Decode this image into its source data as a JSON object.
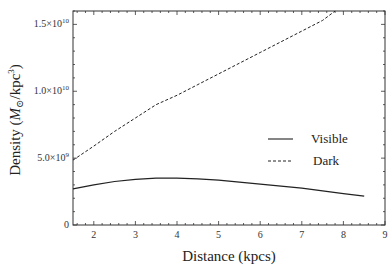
{
  "chart_data": {
    "type": "line",
    "title": "",
    "xlabel": "Distance (kpcs)",
    "ylabel": "Density (M⊙/kpc³)",
    "xlim": [
      1.5,
      9
    ],
    "ylim": [
      0,
      16000000000
    ],
    "x_ticks": [
      2,
      3,
      4,
      5,
      6,
      7,
      8,
      9
    ],
    "y_ticks": [
      {
        "value": 0,
        "label": "0"
      },
      {
        "value": 5000000000,
        "mantissa": "5.0",
        "exp": "9"
      },
      {
        "value": 10000000000,
        "mantissa": "1.0",
        "exp": "10"
      },
      {
        "value": 15000000000,
        "mantissa": "1.5",
        "exp": "10"
      }
    ],
    "grid": false,
    "legend_position": "center-right",
    "series": [
      {
        "name": "Visible",
        "style": "solid",
        "x": [
          1.5,
          2.0,
          2.5,
          3.0,
          3.5,
          4.0,
          4.5,
          5.0,
          5.5,
          6.0,
          6.5,
          7.0,
          7.5,
          8.0,
          8.5
        ],
        "values": [
          2700000000.0,
          3000000000.0,
          3250000000.0,
          3420000000.0,
          3500000000.0,
          3500000000.0,
          3450000000.0,
          3350000000.0,
          3200000000.0,
          3050000000.0,
          2900000000.0,
          2750000000.0,
          2550000000.0,
          2350000000.0,
          2150000000.0
        ]
      },
      {
        "name": "Dark",
        "style": "dashed",
        "x": [
          1.5,
          2.0,
          2.5,
          3.0,
          3.5,
          4.0,
          4.5,
          5.0,
          5.5,
          6.0,
          6.5,
          7.0,
          7.5,
          7.8
        ],
        "values": [
          4850000000.0,
          5900000000.0,
          7000000000.0,
          8000000000.0,
          9000000000.0,
          9700000000.0,
          10500000000.0,
          11300000000.0,
          12100000000.0,
          12900000000.0,
          13700000000.0,
          14500000000.0,
          15300000000.0,
          16000000000.0
        ]
      }
    ]
  },
  "axes": {
    "xlabel": "Distance (kpcs)",
    "ylabel_prefix": "Density (",
    "ylabel_unit_M": "M",
    "ylabel_unit_sub": "⊙",
    "ylabel_unit_rest": "/kpc",
    "ylabel_unit_exp": "3",
    "ylabel_suffix": ")"
  },
  "legend": {
    "items": [
      {
        "label": "Visible",
        "style": "solid"
      },
      {
        "label": "Dark",
        "style": "dashed"
      }
    ]
  },
  "colors": {
    "line": "#222222",
    "axis": "#333333",
    "background": "#ffffff"
  }
}
